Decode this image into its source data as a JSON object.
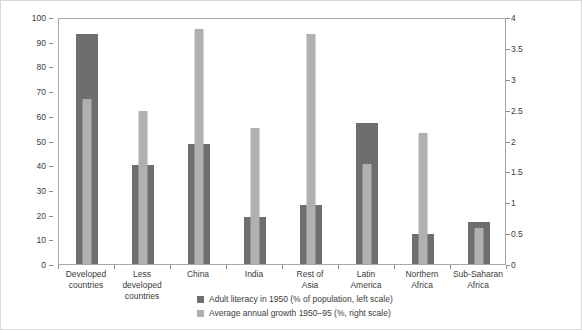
{
  "chart_data": {
    "type": "bar",
    "title": "",
    "subtitle": "",
    "xlabel": "",
    "categories": [
      "Developed\ncountries",
      "Less\ndeveloped\ncountries",
      "China",
      "India",
      "Rest of\nAsia",
      "Latin\nAmerica",
      "Northern\nAfrica",
      "Sub-Saharan\nAfrica"
    ],
    "series": [
      {
        "name": "Adult literacy in 1950 (% of population, left scale)",
        "axis": "left",
        "color": "#6e6e6e",
        "values": [
          93,
          40,
          48.5,
          19,
          24,
          57,
          12,
          17
        ]
      },
      {
        "name": "Average annual growth 1950–95 (%, right scale)",
        "axis": "right",
        "color": "#b0b0b0",
        "values": [
          2.68,
          2.48,
          3.8,
          2.2,
          3.72,
          1.62,
          2.12,
          0.58
        ]
      }
    ],
    "left_axis": {
      "ylabel": "",
      "ylim": [
        0,
        100
      ],
      "ticks": [
        0,
        10,
        20,
        30,
        40,
        50,
        60,
        70,
        80,
        90,
        100
      ],
      "ticklabels": [
        "0",
        "10",
        "20",
        "30",
        "40",
        "50",
        "60",
        "70",
        "80",
        "90",
        "100"
      ]
    },
    "right_axis": {
      "ylabel": "",
      "ylim": [
        0,
        4
      ],
      "ticks": [
        0,
        0.5,
        1,
        1.5,
        2,
        2.5,
        3,
        3.5,
        4
      ],
      "ticklabels": [
        "0",
        "0.5",
        "1",
        "1.5",
        "2",
        "2.5",
        "3",
        "3.5",
        "4"
      ]
    },
    "grid": false,
    "legend": {
      "position": "bottom-center",
      "entries": [
        {
          "label": "Adult literacy in 1950 (% of population, left scale)",
          "color": "#6e6e6e"
        },
        {
          "label": "Average annual growth 1950–95 (%, right scale)",
          "color": "#b0b0b0"
        }
      ]
    }
  }
}
